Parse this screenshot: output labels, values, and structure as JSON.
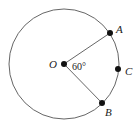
{
  "diagram": {
    "type": "circle-geometry",
    "circle": {
      "cx": 64,
      "cy": 64,
      "r": 55,
      "stroke": "#555555"
    },
    "center": {
      "label": "O",
      "x": 64,
      "y": 64
    },
    "points": [
      {
        "label": "A",
        "x": 110,
        "y": 33
      },
      {
        "label": "C",
        "x": 118,
        "y": 69
      },
      {
        "label": "B",
        "x": 102,
        "y": 103
      }
    ],
    "angle_label": "60°",
    "segments": [
      [
        "O",
        "A"
      ],
      [
        "O",
        "B"
      ]
    ]
  }
}
